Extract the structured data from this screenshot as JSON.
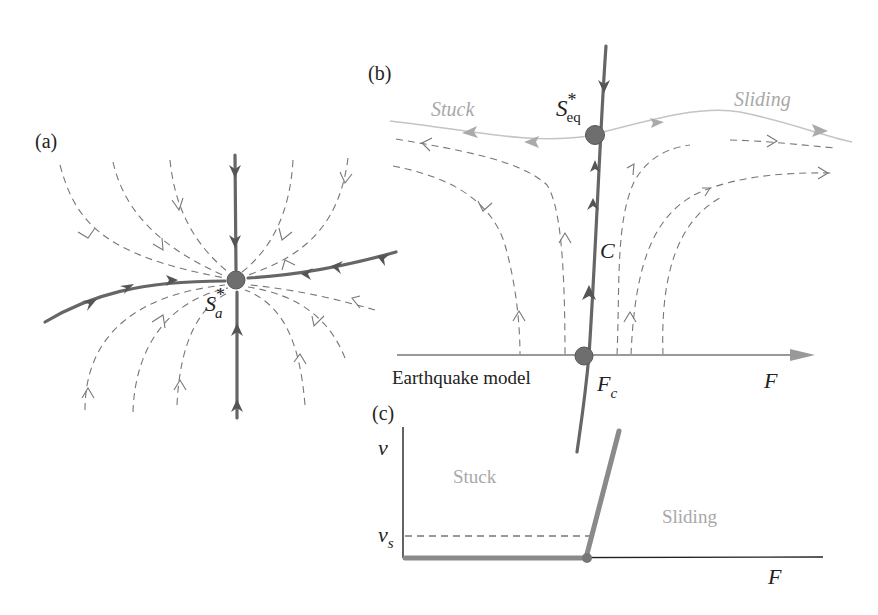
{
  "figure": {
    "panel_a": {
      "label": "(a)",
      "fixed_point_label": "S",
      "fixed_point_sup": "*",
      "fixed_point_sub": "a"
    },
    "panel_b": {
      "label": "(b)",
      "fixed_point_label": "S",
      "fixed_point_sup": "*",
      "fixed_point_sub": "eq",
      "stuck_label": "Stuck",
      "sliding_label": "Sliding",
      "curve_label": "C",
      "axis_label": "F",
      "critical_label": "F",
      "critical_sub": "c",
      "model_label": "Earthquake model"
    },
    "panel_c": {
      "label": "(c)",
      "y_axis_label": "v",
      "threshold_label": "v",
      "threshold_sub": "s",
      "x_axis_label": "F",
      "stuck_label": "Stuck",
      "sliding_label": "Sliding"
    }
  }
}
